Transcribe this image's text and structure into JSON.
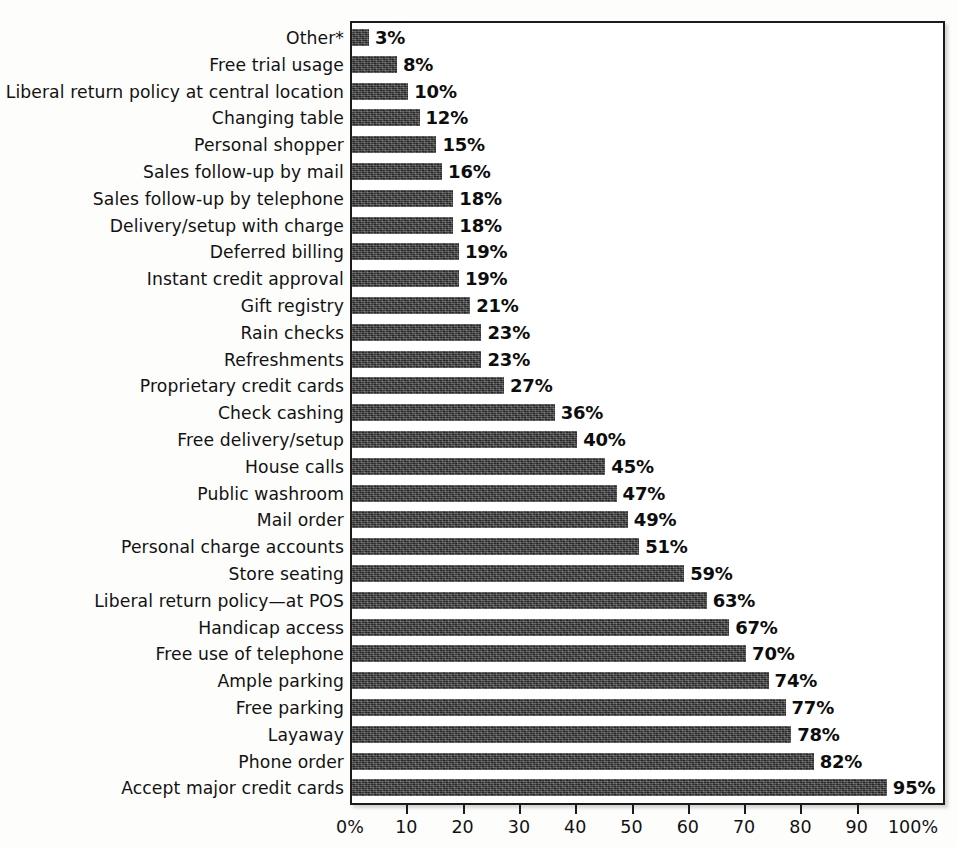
{
  "chart_data": {
    "type": "bar",
    "orientation": "horizontal",
    "title": "",
    "subtitle": "",
    "xlabel": "",
    "ylabel": "",
    "xlim": [
      0,
      100
    ],
    "grid": false,
    "legend": null,
    "value_suffix": "%",
    "categories": [
      "Other*",
      "Free trial usage",
      "Liberal return policy at central location",
      "Changing table",
      "Personal shopper",
      "Sales follow-up by mail",
      "Sales follow-up by telephone",
      "Delivery/setup with charge",
      "Deferred billing",
      "Instant credit approval",
      "Gift registry",
      "Rain checks",
      "Refreshments",
      "Proprietary credit cards",
      "Check cashing",
      "Free delivery/setup",
      "House calls",
      "Public washroom",
      "Mail order",
      "Personal charge accounts",
      "Store seating",
      "Liberal return policy—at POS",
      "Handicap access",
      "Free use of telephone",
      "Ample parking",
      "Free parking",
      "Layaway",
      "Phone order",
      "Accept major credit cards"
    ],
    "values": [
      3,
      8,
      10,
      12,
      15,
      16,
      18,
      18,
      19,
      19,
      21,
      23,
      23,
      27,
      36,
      40,
      45,
      47,
      49,
      51,
      59,
      63,
      67,
      70,
      74,
      77,
      78,
      82,
      95
    ],
    "value_labels": [
      "3%",
      "8%",
      "10%",
      "12%",
      "15%",
      "16%",
      "18%",
      "18%",
      "19%",
      "19%",
      "21%",
      "23%",
      "23%",
      "27%",
      "36%",
      "40%",
      "45%",
      "47%",
      "49%",
      "51%",
      "59%",
      "63%",
      "67%",
      "70%",
      "74%",
      "77%",
      "78%",
      "82%",
      "95%"
    ],
    "xticks": [
      0,
      10,
      20,
      30,
      40,
      50,
      60,
      70,
      80,
      90,
      100
    ],
    "xticklabels": [
      "0%",
      "10",
      "20",
      "30",
      "40",
      "50",
      "60",
      "70",
      "80",
      "90",
      "100%"
    ],
    "bar_color": "#3c3c3c",
    "frame_color": "#1b1b1b",
    "text_color": "#121212"
  }
}
